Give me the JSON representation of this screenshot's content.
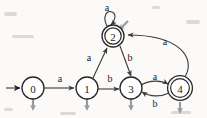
{
  "figure": {
    "type": "state-diagram",
    "background_color": "#fbfaf8",
    "stroke_color": "#262626",
    "output_arrow_color": "#9a9a9a"
  },
  "states": [
    {
      "id": "0",
      "label": "0",
      "cx": 33,
      "cy": 88,
      "r": 11,
      "accepting": false,
      "start": true,
      "has_output_arrow": true
    },
    {
      "id": "1",
      "label": "1",
      "cx": 87,
      "cy": 88,
      "r": 11,
      "accepting": false,
      "start": false,
      "has_output_arrow": true
    },
    {
      "id": "2",
      "label": "2",
      "cx": 113,
      "cy": 36,
      "r": 11,
      "accepting": true,
      "start": false,
      "has_output_arrow": true
    },
    {
      "id": "3",
      "label": "3",
      "cx": 131,
      "cy": 88,
      "r": 11,
      "accepting": false,
      "start": false,
      "has_output_arrow": true
    },
    {
      "id": "4",
      "label": "4",
      "cx": 180,
      "cy": 88,
      "r": 11,
      "accepting": true,
      "start": false,
      "has_output_arrow": true
    }
  ],
  "transitions": [
    {
      "id": "t0",
      "from": "0",
      "to": "1",
      "symbol": "a",
      "label_x": 60,
      "label_y": 78
    },
    {
      "id": "t1",
      "from": "1",
      "to": "2",
      "symbol": "a",
      "label_x": 89,
      "label_y": 57
    },
    {
      "id": "t2",
      "from": "1",
      "to": "3",
      "symbol": "b",
      "label_x": 110,
      "label_y": 78
    },
    {
      "id": "t3",
      "from": "2",
      "to": "2",
      "symbol": "a",
      "label_x": 107,
      "label_y": 7,
      "self_loop": true
    },
    {
      "id": "t4",
      "from": "2",
      "to": "3",
      "symbol": "b",
      "label_x": 130,
      "label_y": 57
    },
    {
      "id": "t5",
      "from": "3",
      "to": "4",
      "symbol": "a",
      "label_x": 155,
      "label_y": 76
    },
    {
      "id": "t6",
      "from": "4",
      "to": "3",
      "symbol": "b",
      "label_x": 155,
      "label_y": 103
    },
    {
      "id": "t7",
      "from": "4",
      "to": "2",
      "symbol": "a",
      "label_x": 165,
      "label_y": 41,
      "curved": true
    }
  ],
  "alphabet": [
    "a",
    "b"
  ],
  "start_state": "0",
  "accepting_states": [
    "2",
    "4"
  ]
}
